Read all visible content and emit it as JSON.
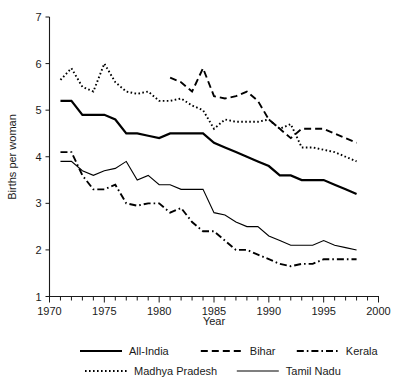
{
  "chart_data": {
    "type": "line",
    "title": "",
    "xlabel": "Year",
    "ylabel": "Births per woman",
    "xlim": [
      1970,
      2000
    ],
    "ylim": [
      1,
      7
    ],
    "xticks": [
      1970,
      1971,
      1972,
      1973,
      1974,
      1975,
      1976,
      1977,
      1978,
      1979,
      1980,
      1981,
      1982,
      1983,
      1984,
      1985,
      1986,
      1987,
      1988,
      1989,
      1990,
      1991,
      1992,
      1993,
      1994,
      1995,
      1996,
      1997,
      1998,
      1999,
      2000
    ],
    "xtick_labels": [
      "1970",
      "1975",
      "1980",
      "1985",
      "1990",
      "1995",
      "2000"
    ],
    "xtick_label_values": [
      1970,
      1975,
      1980,
      1985,
      1990,
      1995,
      2000
    ],
    "yticks": [
      1,
      2,
      3,
      4,
      5,
      6,
      7
    ],
    "ytick_labels": [
      "1",
      "2",
      "3",
      "4",
      "5",
      "6",
      "7"
    ],
    "grid": false,
    "legend_position": "below",
    "series": [
      {
        "name": "All-India",
        "style": "solid-thick",
        "x": [
          1971,
          1972,
          1973,
          1974,
          1975,
          1976,
          1977,
          1978,
          1979,
          1980,
          1981,
          1982,
          1983,
          1984,
          1985,
          1986,
          1987,
          1988,
          1989,
          1990,
          1991,
          1992,
          1993,
          1994,
          1995,
          1996,
          1997,
          1998
        ],
        "values": [
          5.2,
          5.2,
          4.9,
          4.9,
          4.9,
          4.8,
          4.5,
          4.5,
          4.45,
          4.4,
          4.5,
          4.5,
          4.5,
          4.5,
          4.3,
          4.2,
          4.1,
          4.0,
          3.9,
          3.8,
          3.6,
          3.6,
          3.5,
          3.5,
          3.5,
          3.4,
          3.3,
          3.2
        ]
      },
      {
        "name": "Bihar",
        "style": "dashed",
        "x": [
          1981,
          1982,
          1983,
          1984,
          1985,
          1986,
          1987,
          1988,
          1989,
          1990,
          1991,
          1992,
          1993,
          1994,
          1995,
          1996,
          1997,
          1998
        ],
        "values": [
          5.7,
          5.6,
          5.4,
          5.9,
          5.3,
          5.25,
          5.3,
          5.4,
          5.2,
          4.8,
          4.6,
          4.4,
          4.6,
          4.6,
          4.6,
          4.5,
          4.4,
          4.3
        ]
      },
      {
        "name": "Kerala",
        "style": "dash-dot",
        "x": [
          1971,
          1972,
          1973,
          1974,
          1975,
          1976,
          1977,
          1978,
          1979,
          1980,
          1981,
          1982,
          1983,
          1984,
          1985,
          1986,
          1987,
          1988,
          1989,
          1990,
          1991,
          1992,
          1993,
          1994,
          1995,
          1996,
          1997,
          1998
        ],
        "values": [
          4.1,
          4.1,
          3.6,
          3.3,
          3.3,
          3.4,
          3.0,
          2.95,
          3.0,
          3.0,
          2.8,
          2.9,
          2.6,
          2.4,
          2.4,
          2.2,
          2.0,
          2.0,
          1.9,
          1.8,
          1.7,
          1.65,
          1.7,
          1.7,
          1.8,
          1.8,
          1.8,
          1.8
        ]
      },
      {
        "name": "Madhya Pradesh",
        "style": "dotted",
        "x": [
          1971,
          1972,
          1973,
          1974,
          1975,
          1976,
          1977,
          1978,
          1979,
          1980,
          1981,
          1982,
          1983,
          1984,
          1985,
          1986,
          1987,
          1988,
          1989,
          1990,
          1991,
          1992,
          1993,
          1994,
          1995,
          1996,
          1997,
          1998
        ],
        "values": [
          5.65,
          5.9,
          5.5,
          5.4,
          6.0,
          5.6,
          5.4,
          5.35,
          5.4,
          5.2,
          5.2,
          5.25,
          5.1,
          5.0,
          4.6,
          4.8,
          4.75,
          4.75,
          4.75,
          4.8,
          4.6,
          4.7,
          4.2,
          4.2,
          4.15,
          4.1,
          4.0,
          3.9
        ]
      },
      {
        "name": "Tamil Nadu",
        "style": "solid-thin",
        "x": [
          1971,
          1972,
          1973,
          1974,
          1975,
          1976,
          1977,
          1978,
          1979,
          1980,
          1981,
          1982,
          1983,
          1984,
          1985,
          1986,
          1987,
          1988,
          1989,
          1990,
          1991,
          1992,
          1993,
          1994,
          1995,
          1996,
          1997,
          1998
        ],
        "values": [
          3.9,
          3.9,
          3.7,
          3.6,
          3.7,
          3.75,
          3.9,
          3.5,
          3.6,
          3.4,
          3.4,
          3.3,
          3.3,
          3.3,
          2.8,
          2.75,
          2.6,
          2.5,
          2.5,
          2.3,
          2.2,
          2.1,
          2.1,
          2.1,
          2.2,
          2.1,
          2.05,
          2.0
        ]
      }
    ]
  },
  "legend": {
    "rows": [
      [
        {
          "label": "All-India",
          "style": "solid-thick"
        },
        {
          "label": "Bihar",
          "style": "dashed"
        },
        {
          "label": "Kerala",
          "style": "dash-dot"
        }
      ],
      [
        {
          "label": "Madhya Pradesh",
          "style": "dotted"
        },
        {
          "label": "Tamil Nadu",
          "style": "solid-thin"
        }
      ]
    ]
  }
}
